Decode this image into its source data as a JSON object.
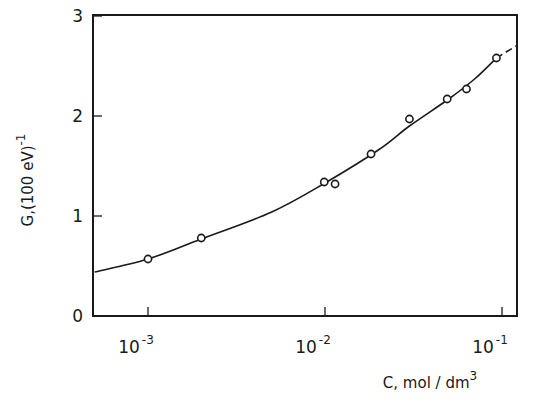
{
  "chart_data": {
    "type": "scatter",
    "title": "",
    "xlabel": "C, mol / dm3",
    "xlabel_parts": {
      "main": "C, mol / dm",
      "sup": "3"
    },
    "ylabel": "G,(100 eV)-1",
    "ylabel_parts": {
      "main": "G,(100 eV)",
      "sup": "-1"
    },
    "xscale": "log",
    "xlim": [
      0.0005,
      0.13
    ],
    "ylim": [
      0,
      3.1
    ],
    "grid": false,
    "legend": null,
    "x_ticks": [
      {
        "value": 0.001,
        "base": "10",
        "exp": "-3"
      },
      {
        "value": 0.01,
        "base": "10",
        "exp": "-2"
      },
      {
        "value": 0.1,
        "base": "10",
        "exp": "-1"
      }
    ],
    "y_ticks": [
      {
        "value": 0,
        "label": "0"
      },
      {
        "value": 1,
        "label": "1"
      },
      {
        "value": 2,
        "label": "2"
      },
      {
        "value": 3,
        "label": "3"
      }
    ],
    "series": [
      {
        "name": "measured",
        "marker": "open-circle",
        "x": [
          0.001,
          0.002,
          0.0099,
          0.0114,
          0.0182,
          0.03,
          0.049,
          0.063,
          0.093
        ],
        "y": [
          0.57,
          0.78,
          1.34,
          1.32,
          1.62,
          1.97,
          2.17,
          2.27,
          2.58
        ]
      },
      {
        "name": "fitted curve",
        "line": "solid",
        "x": [
          0.0005,
          0.001,
          0.002,
          0.005,
          0.01,
          0.02,
          0.03,
          0.05,
          0.07,
          0.093
        ],
        "y": [
          0.44,
          0.57,
          0.77,
          1.04,
          1.33,
          1.66,
          1.9,
          2.17,
          2.37,
          2.58
        ]
      },
      {
        "name": "extrapolation",
        "line": "dashed",
        "x": [
          0.093,
          0.12
        ],
        "y": [
          2.58,
          2.7
        ]
      }
    ]
  }
}
